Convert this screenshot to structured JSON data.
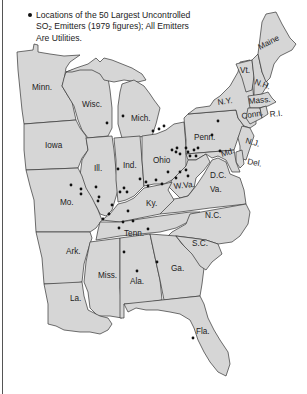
{
  "legend": {
    "line1": "Locations of the 50 Largest Uncontrolled",
    "line2_prefix": "SO",
    "line2_sub": "2",
    "line2_suffix": " Emitters (1979 figures); All Emitters",
    "line3": "Are Utilities.",
    "marker": "bullet-dot"
  },
  "colors": {
    "state_fill": "#d6d6d6",
    "border": "#333333",
    "dot": "#111111",
    "background": "#ffffff"
  },
  "states": {
    "minn": "Minn.",
    "wisc": "Wisc.",
    "mich": "Mich.",
    "iowa": "Iowa",
    "ill": "Ill.",
    "ind": "Ind.",
    "ohio": "Ohio",
    "penn": "Penn.",
    "ny": "N.Y.",
    "vt": "Vt.",
    "nh": "N.H.",
    "maine": "Maine",
    "mass": "Mass.",
    "conn": "Conn.",
    "ri": "R.I.",
    "nj": "N.J.",
    "del": "Del.",
    "md": "Md.",
    "dc": "D.C.",
    "wva": "W.Va.",
    "va": "Va.",
    "mo": "Mo.",
    "ky": "Ky.",
    "nc": "N.C.",
    "tenn": "Tenn.",
    "ark": "Ark.",
    "sc": "S.C.",
    "miss": "Miss.",
    "ala": "Ala.",
    "ga": "Ga.",
    "la": "La.",
    "fla": "Fla."
  },
  "emitter_count": 50
}
